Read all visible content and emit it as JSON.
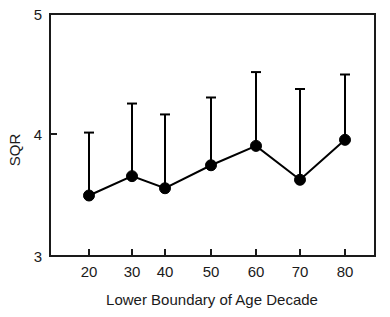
{
  "chart_data": {
    "type": "line",
    "title": "",
    "subtitle": "",
    "xlabel": "Lower Boundary of Age Decade",
    "ylabel": "SQR",
    "xlim": [
      10,
      90
    ],
    "ylim": [
      3,
      5
    ],
    "xticks": [
      20,
      30,
      40,
      50,
      60,
      70,
      80
    ],
    "xtick_labels": [
      "20",
      "30",
      "40",
      "50",
      "60",
      "70",
      "80"
    ],
    "yticks": [
      3,
      4,
      5
    ],
    "ytick_labels": [
      "3",
      "4",
      "5"
    ],
    "grid": false,
    "legend": null,
    "categories": [
      20,
      30,
      40,
      50,
      60,
      70,
      80
    ],
    "series": [
      {
        "name": "SQR",
        "marker": "filled-circle",
        "color": "#000000",
        "values": [
          3.5,
          3.66,
          3.56,
          3.75,
          3.91,
          3.63,
          3.96
        ],
        "error_upper": [
          4.02,
          4.26,
          4.17,
          4.31,
          4.52,
          4.38,
          4.5
        ],
        "error_style": "upper-only-with-cap"
      }
    ],
    "points": [
      {
        "x": 20,
        "y": 3.5,
        "upper": 4.02
      },
      {
        "x": 30,
        "y": 3.66,
        "upper": 4.26
      },
      {
        "x": 40,
        "y": 3.56,
        "upper": 4.17
      },
      {
        "x": 50,
        "y": 3.75,
        "upper": 4.31
      },
      {
        "x": 60,
        "y": 3.91,
        "upper": 4.52
      },
      {
        "x": 70,
        "y": 3.63,
        "upper": 4.38
      },
      {
        "x": 80,
        "y": 3.96,
        "upper": 4.5
      }
    ]
  },
  "axes": {
    "y_label": "SQR",
    "x_label": "Lower Boundary of Age Decade",
    "y_tick_top": "5",
    "y_tick_mid": "4",
    "y_tick_bottom": "3",
    "x_tick_1": "20",
    "x_tick_2": "30",
    "x_tick_3": "40",
    "x_tick_4": "50",
    "x_tick_5": "60",
    "x_tick_6": "70",
    "x_tick_7": "80"
  },
  "colors": {
    "background": "#ffffff",
    "foreground": "#1a1a1a",
    "series": "#000000"
  }
}
